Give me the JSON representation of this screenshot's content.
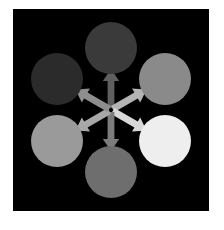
{
  "figure": {
    "background_color": "#ffffff",
    "panel_color": "#000000",
    "panel": {
      "x": 13,
      "y": 9,
      "width": 196,
      "height": 202
    }
  },
  "diagram": {
    "type": "radial-hub-and-spoke",
    "center": {
      "x": 98,
      "y": 101
    },
    "node_radius": 26,
    "orbit_radius": 62,
    "nodes": [
      {
        "id": "node-top",
        "label": "top-node",
        "position_label": "top",
        "cx": 98,
        "cy": 39,
        "r": 26,
        "color": "#3a3a3a",
        "brightness": 58
      },
      {
        "id": "node-upper-right",
        "label": "upper-right-node",
        "position_label": "upper-right",
        "cx": 152,
        "cy": 70,
        "r": 26,
        "color": "#8a8a8a",
        "brightness": 138
      },
      {
        "id": "node-lower-right",
        "label": "lower-right-node",
        "position_label": "lower-right",
        "cx": 152,
        "cy": 132,
        "r": 26,
        "color": "#eeeeee",
        "brightness": 238
      },
      {
        "id": "node-bottom",
        "label": "bottom-node",
        "position_label": "bottom",
        "cx": 98,
        "cy": 163,
        "r": 26,
        "color": "#6e6e6e",
        "brightness": 110
      },
      {
        "id": "node-lower-left",
        "label": "lower-left-node",
        "position_label": "lower-left",
        "cx": 44,
        "cy": 132,
        "r": 26,
        "color": "#9a9a9a",
        "brightness": 154
      },
      {
        "id": "node-upper-left",
        "label": "upper-left-node",
        "position_label": "upper-left",
        "cx": 44,
        "cy": 70,
        "r": 26,
        "color": "#2b2b2b",
        "brightness": 43
      }
    ],
    "arrows": [
      {
        "id": "arrow-to-top",
        "label": "arrow-to-top-node",
        "target": "node-top",
        "angle_deg": 270,
        "color": "#5f5f5f",
        "brightness": 95
      },
      {
        "id": "arrow-to-upper-right",
        "label": "arrow-to-upper-right-node",
        "target": "node-upper-right",
        "angle_deg": 330,
        "color": "#b4b4b4",
        "brightness": 180
      },
      {
        "id": "arrow-to-lower-right",
        "label": "arrow-to-lower-right-node",
        "target": "node-lower-right",
        "angle_deg": 30,
        "color": "#d8d8d8",
        "brightness": 216
      },
      {
        "id": "arrow-to-bottom",
        "label": "arrow-to-bottom-node",
        "target": "node-bottom",
        "angle_deg": 90,
        "color": "#7c7c7c",
        "brightness": 124
      },
      {
        "id": "arrow-to-lower-left",
        "label": "arrow-to-lower-left-node",
        "target": "node-lower-left",
        "angle_deg": 150,
        "color": "#a8a8a8",
        "brightness": 168
      },
      {
        "id": "arrow-to-upper-left",
        "label": "arrow-to-upper-left-node",
        "target": "node-upper-left",
        "angle_deg": 210,
        "color": "#8e8e8e",
        "brightness": 142
      }
    ]
  }
}
